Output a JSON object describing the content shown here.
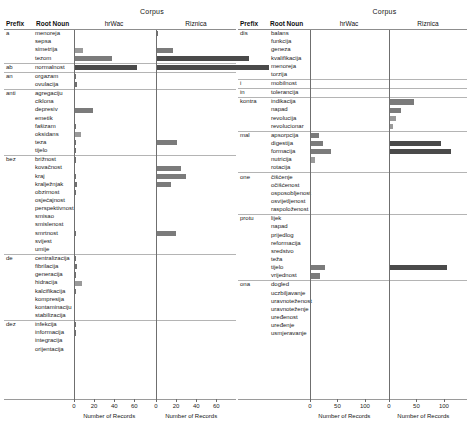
{
  "figure": {
    "corpus_label": "Corpus",
    "col_prefix": "Prefix",
    "col_root": "Root Noun",
    "corpora": [
      "hrWac",
      "Riznica"
    ],
    "axis_title": "Number of Records"
  },
  "chart_data": {
    "type": "bar",
    "title": "Corpus",
    "xlabel": "Number of Records",
    "ylabel": "Root Noun",
    "orientation": "horizontal",
    "facets": [
      "hrWac",
      "Riznica"
    ],
    "panels": [
      {
        "id": "left-panel",
        "xlim": [
          0,
          70
        ],
        "xticks": [
          0,
          20,
          40,
          60
        ],
        "xticklabels": [
          "0",
          "20",
          "40",
          "60"
        ],
        "groups": [
          {
            "prefix": "a",
            "rows": [
              {
                "root": "menoreja",
                "hrWac": 0,
                "Riznica": 2
              },
              {
                "root": "sepsa",
                "hrWac": 1,
                "Riznica": 1
              },
              {
                "root": "simetrija",
                "hrWac": 9,
                "Riznica": 17
              },
              {
                "root": "tezom",
                "hrWac": 38,
                "Riznica": 92
              }
            ]
          },
          {
            "prefix": "ab",
            "rows": [
              {
                "root": "normalnost",
                "hrWac": 63,
                "Riznica": 112
              }
            ]
          },
          {
            "prefix": "an",
            "rows": [
              {
                "root": "orgazam",
                "hrWac": 2,
                "Riznica": 0
              },
              {
                "root": "ovulacija",
                "hrWac": 3,
                "Riznica": 0
              }
            ]
          },
          {
            "prefix": "anti",
            "rows": [
              {
                "root": "agregaciju",
                "hrWac": 1,
                "Riznica": 0
              },
              {
                "root": "ciklona",
                "hrWac": 1,
                "Riznica": 0
              },
              {
                "root": "depresiv",
                "hrWac": 19,
                "Riznica": 0
              },
              {
                "root": "emetik",
                "hrWac": 1,
                "Riznica": 0
              },
              {
                "root": "fašizam",
                "hrWac": 2,
                "Riznica": 0
              },
              {
                "root": "oksidans",
                "hrWac": 7,
                "Riznica": 0
              },
              {
                "root": "teza",
                "hrWac": 2,
                "Riznica": 21
              },
              {
                "root": "tijelo",
                "hrWac": 2,
                "Riznica": 0
              }
            ]
          },
          {
            "prefix": "bez",
            "rows": [
              {
                "root": "brižnost",
                "hrWac": 2,
                "Riznica": 0
              },
              {
                "root": "kovačnost",
                "hrWac": 1,
                "Riznica": 25
              },
              {
                "root": "kraj",
                "hrWac": 2,
                "Riznica": 30
              },
              {
                "root": "kralježnjak",
                "hrWac": 3,
                "Riznica": 15
              },
              {
                "root": "obzirnost",
                "hrWac": 2,
                "Riznica": 0
              },
              {
                "root": "osjećajnost",
                "hrWac": 1,
                "Riznica": 0
              },
              {
                "root": "perspektivnost",
                "hrWac": 1,
                "Riznica": 0
              },
              {
                "root": "smisao",
                "hrWac": 1,
                "Riznica": 0
              },
              {
                "root": "smislenost",
                "hrWac": 1,
                "Riznica": 0
              },
              {
                "root": "smrtnost",
                "hrWac": 2,
                "Riznica": 20
              },
              {
                "root": "svijest",
                "hrWac": 1,
                "Riznica": 0
              },
              {
                "root": "umije",
                "hrWac": 1,
                "Riznica": 0
              }
            ]
          },
          {
            "prefix": "de",
            "rows": [
              {
                "root": "centralizacija",
                "hrWac": 2,
                "Riznica": 0
              },
              {
                "root": "fibrilacija",
                "hrWac": 3,
                "Riznica": 0
              },
              {
                "root": "generacija",
                "hrWac": 2,
                "Riznica": 0
              },
              {
                "root": "hidracija",
                "hrWac": 8,
                "Riznica": 0
              },
              {
                "root": "kalcifikacija",
                "hrWac": 2,
                "Riznica": 0
              },
              {
                "root": "kompresija",
                "hrWac": 1,
                "Riznica": 0
              },
              {
                "root": "kontaminaciju",
                "hrWac": 1,
                "Riznica": 0
              },
              {
                "root": "stabilizacija",
                "hrWac": 1,
                "Riznica": 0
              }
            ]
          },
          {
            "prefix": "dez",
            "rows": [
              {
                "root": "infekcija",
                "hrWac": 2,
                "Riznica": 0
              },
              {
                "root": "informacija",
                "hrWac": 2,
                "Riznica": 0
              },
              {
                "root": "integracija",
                "hrWac": 1,
                "Riznica": 0
              },
              {
                "root": "orijentacija",
                "hrWac": 1,
                "Riznica": 0
              }
            ]
          }
        ]
      },
      {
        "id": "right-panel",
        "xlim": [
          0,
          125
        ],
        "xticks": [
          0,
          50,
          100
        ],
        "xticklabels": [
          "0",
          "50",
          "100"
        ],
        "groups": [
          {
            "prefix": "dis",
            "rows": [
              {
                "root": "balans",
                "hrWac": 2,
                "Riznica": 0
              },
              {
                "root": "funkcija",
                "hrWac": 2,
                "Riznica": 0
              },
              {
                "root": "geneza",
                "hrWac": 1,
                "Riznica": 0
              },
              {
                "root": "kvalifikacija",
                "hrWac": 1,
                "Riznica": 0
              },
              {
                "root": "menoreja",
                "hrWac": 1,
                "Riznica": 0
              },
              {
                "root": "torzija",
                "hrWac": 1,
                "Riznica": 0
              }
            ]
          },
          {
            "prefix": "i",
            "rows": [
              {
                "root": "mobilnost",
                "hrWac": 1,
                "Riznica": 0
              }
            ]
          },
          {
            "prefix": "in",
            "rows": [
              {
                "root": "tolerancija",
                "hrWac": 1,
                "Riznica": 0
              }
            ]
          },
          {
            "prefix": "kontra",
            "rows": [
              {
                "root": "indikacija",
                "hrWac": 2,
                "Riznica": 46
              },
              {
                "root": "napad",
                "hrWac": 2,
                "Riznica": 22
              },
              {
                "root": "revolucija",
                "hrWac": 1,
                "Riznica": 12
              },
              {
                "root": "revolucionar",
                "hrWac": 1,
                "Riznica": 8
              }
            ]
          },
          {
            "prefix": "mal",
            "rows": [
              {
                "root": "apsorpcija",
                "hrWac": 17,
                "Riznica": 0
              },
              {
                "root": "digestija",
                "hrWac": 24,
                "Riznica": 95
              },
              {
                "root": "formacija",
                "hrWac": 39,
                "Riznica": 112
              },
              {
                "root": "nutricija",
                "hrWac": 10,
                "Riznica": 0
              },
              {
                "root": "rotacija",
                "hrWac": 2,
                "Riznica": 0
              }
            ]
          },
          {
            "prefix": "one",
            "rows": [
              {
                "root": "čišćenje",
                "hrWac": 2,
                "Riznica": 0
              },
              {
                "root": "očišćenost",
                "hrWac": 2,
                "Riznica": 0
              },
              {
                "root": "osposobljenost",
                "hrWac": 2,
                "Riznica": 0
              },
              {
                "root": "osvijetljenost",
                "hrWac": 1,
                "Riznica": 0
              },
              {
                "root": "raspoloženost",
                "hrWac": 1,
                "Riznica": 0
              }
            ]
          },
          {
            "prefix": "protu",
            "rows": [
              {
                "root": "lijek",
                "hrWac": 2,
                "Riznica": 0
              },
              {
                "root": "napad",
                "hrWac": 2,
                "Riznica": 0
              },
              {
                "root": "prijedlog",
                "hrWac": 2,
                "Riznica": 0
              },
              {
                "root": "reformacija",
                "hrWac": 1,
                "Riznica": 0
              },
              {
                "root": "sredstvo",
                "hrWac": 2,
                "Riznica": 0
              },
              {
                "root": "teža",
                "hrWac": 2,
                "Riznica": 0
              },
              {
                "root": "tijelo",
                "hrWac": 28,
                "Riznica": 105
              },
              {
                "root": "vrijednost",
                "hrWac": 18,
                "Riznica": 0
              }
            ]
          },
          {
            "prefix": "ona",
            "rows": [
              {
                "root": "dogled",
                "hrWac": 2,
                "Riznica": 0
              },
              {
                "root": "uczbiljavanje",
                "hrWac": 2,
                "Riznica": 0
              },
              {
                "root": "uravnoteženost",
                "hrWac": 1,
                "Riznica": 0
              },
              {
                "root": "uravnoteženje",
                "hrWac": 1,
                "Riznica": 0
              },
              {
                "root": "uređenost",
                "hrWac": 1,
                "Riznica": 0
              },
              {
                "root": "uređenje",
                "hrWac": 1,
                "Riznica": 0
              },
              {
                "root": "usmjeravanje",
                "hrWac": 2,
                "Riznica": 0
              }
            ]
          }
        ]
      }
    ]
  }
}
